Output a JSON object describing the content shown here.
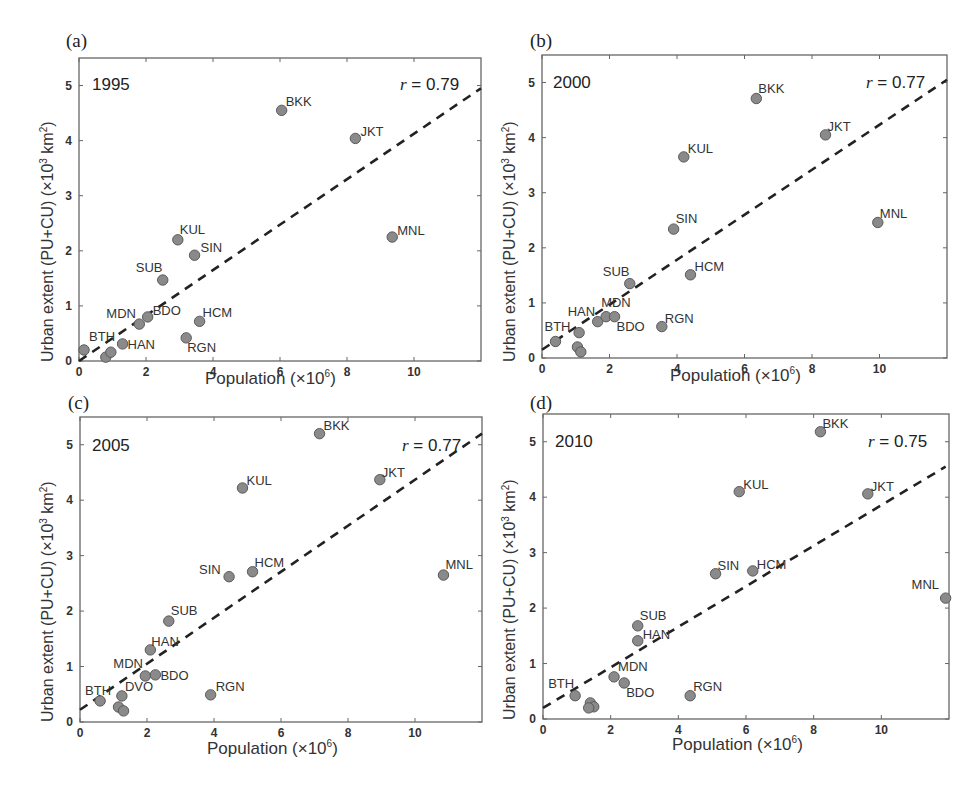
{
  "figure": {
    "xlabel_text": "Population (×10",
    "xlabel_exp": "6",
    "xlabel_close": ")",
    "ylabel_text": "Urban extent (PU+CU) (×10",
    "ylabel_exp": "3",
    "ylabel_unit": " km",
    "ylabel_unit_exp": "2",
    "ylabel_close": ")",
    "r_prefix": "r",
    "colors": {
      "marker_fill": "#8a8a8a",
      "marker_stroke": "#5a5a5a",
      "axis": "#666666",
      "fit_line": "#222222"
    }
  },
  "chart_data": [
    {
      "type": "scatter",
      "panel": "(a)",
      "title": "1995",
      "annotation": "= 0.79",
      "r": 0.79,
      "xlabel": "Population (×10^6)",
      "ylabel": "Urban extent (PU+CU) (×10^3 km^2)",
      "xlim": [
        0,
        12
      ],
      "ylim": [
        0,
        5.5
      ],
      "xticks": [
        0,
        2,
        4,
        6,
        8,
        10
      ],
      "yticks": [
        0,
        1,
        2,
        3,
        4,
        5
      ],
      "grid": false,
      "fit_line": [
        [
          0,
          0.0
        ],
        [
          12,
          4.95
        ]
      ],
      "points": [
        {
          "label": "BTH",
          "x": 0.15,
          "y": 0.2,
          "lx": 5,
          "ly": -9
        },
        {
          "label": "",
          "x": 0.8,
          "y": 0.07
        },
        {
          "label": "",
          "x": 0.95,
          "y": 0.16
        },
        {
          "label": "HAN",
          "x": 1.3,
          "y": 0.31,
          "lx": 5,
          "ly": 5
        },
        {
          "label": "MDN",
          "x": 1.8,
          "y": 0.67,
          "lx": -33,
          "ly": -6
        },
        {
          "label": "BDO",
          "x": 2.05,
          "y": 0.8,
          "lx": 5,
          "ly": -2
        },
        {
          "label": "SUB",
          "x": 2.5,
          "y": 1.47,
          "lx": -27,
          "ly": -8
        },
        {
          "label": "KUL",
          "x": 2.95,
          "y": 2.2,
          "lx": 2,
          "ly": -6
        },
        {
          "label": "SIN",
          "x": 3.45,
          "y": 1.92,
          "lx": 6,
          "ly": -3
        },
        {
          "label": "RGN",
          "x": 3.2,
          "y": 0.42,
          "lx": 1,
          "ly": 14
        },
        {
          "label": "HCM",
          "x": 3.6,
          "y": 0.72,
          "lx": 3,
          "ly": -4
        },
        {
          "label": "BKK",
          "x": 6.05,
          "y": 4.55,
          "lx": 4,
          "ly": -4
        },
        {
          "label": "JKT",
          "x": 8.25,
          "y": 4.04,
          "lx": 5,
          "ly": -2
        },
        {
          "label": "MNL",
          "x": 9.35,
          "y": 2.25,
          "lx": 5,
          "ly": -2
        }
      ]
    },
    {
      "type": "scatter",
      "panel": "(b)",
      "title": "2000",
      "annotation": "= 0.77",
      "r": 0.77,
      "xlabel": "Population (×10^6)",
      "ylabel": "Urban extent (PU+CU) (×10^3 km^2)",
      "xlim": [
        0,
        12
      ],
      "ylim": [
        0,
        5.5
      ],
      "xticks": [
        0,
        2,
        4,
        6,
        8,
        10
      ],
      "yticks": [
        0,
        1,
        2,
        3,
        4,
        5
      ],
      "grid": false,
      "fit_line": [
        [
          0,
          0.15
        ],
        [
          12,
          5.05
        ]
      ],
      "points": [
        {
          "label": "BTH",
          "x": 0.4,
          "y": 0.3,
          "lx": -11,
          "ly": -10
        },
        {
          "label": "",
          "x": 1.1,
          "y": 0.46
        },
        {
          "label": "",
          "x": 1.05,
          "y": 0.2
        },
        {
          "label": "",
          "x": 1.15,
          "y": 0.11
        },
        {
          "label": "HAN",
          "x": 1.65,
          "y": 0.66,
          "lx": -30,
          "ly": -6
        },
        {
          "label": "MDN",
          "x": 1.9,
          "y": 0.75,
          "lx": -5,
          "ly": -10
        },
        {
          "label": "BDO",
          "x": 2.15,
          "y": 0.75,
          "lx": 2,
          "ly": 14
        },
        {
          "label": "SUB",
          "x": 2.6,
          "y": 1.35,
          "lx": -27,
          "ly": -8
        },
        {
          "label": "RGN",
          "x": 3.55,
          "y": 0.57,
          "lx": 3,
          "ly": -4
        },
        {
          "label": "SIN",
          "x": 3.9,
          "y": 2.34,
          "lx": 2,
          "ly": -6
        },
        {
          "label": "HCM",
          "x": 4.4,
          "y": 1.51,
          "lx": 4,
          "ly": -4
        },
        {
          "label": "KUL",
          "x": 4.2,
          "y": 3.65,
          "lx": 4,
          "ly": -4
        },
        {
          "label": "BKK",
          "x": 6.35,
          "y": 4.71,
          "lx": 2,
          "ly": -6
        },
        {
          "label": "JKT",
          "x": 8.4,
          "y": 4.05,
          "lx": 2,
          "ly": -4
        },
        {
          "label": "MNL",
          "x": 9.95,
          "y": 2.46,
          "lx": 2,
          "ly": -4
        }
      ]
    },
    {
      "type": "scatter",
      "panel": "(c)",
      "title": "2005",
      "annotation": "= 0.77",
      "r": 0.77,
      "xlabel": "Population (×10^6)",
      "ylabel": "Urban extent (PU+CU) (×10^3 km^2)",
      "xlim": [
        0,
        12
      ],
      "ylim": [
        0,
        5.5
      ],
      "xticks": [
        0,
        2,
        4,
        6,
        8,
        10
      ],
      "yticks": [
        0,
        1,
        2,
        3,
        4,
        5
      ],
      "grid": false,
      "fit_line": [
        [
          0,
          0.22
        ],
        [
          12,
          5.2
        ]
      ],
      "points": [
        {
          "label": "BTH",
          "x": 0.6,
          "y": 0.38,
          "lx": -15,
          "ly": -6
        },
        {
          "label": "DVO",
          "x": 1.25,
          "y": 0.47,
          "lx": 3,
          "ly": -5
        },
        {
          "label": "",
          "x": 1.15,
          "y": 0.27
        },
        {
          "label": "",
          "x": 1.3,
          "y": 0.2
        },
        {
          "label": "MDN",
          "x": 1.95,
          "y": 0.83,
          "lx": -32,
          "ly": -8
        },
        {
          "label": "BDO",
          "x": 2.25,
          "y": 0.85,
          "lx": 5,
          "ly": 5
        },
        {
          "label": "HAN",
          "x": 2.1,
          "y": 1.3,
          "lx": 1,
          "ly": -4
        },
        {
          "label": "SUB",
          "x": 2.65,
          "y": 1.82,
          "lx": 2,
          "ly": -6
        },
        {
          "label": "RGN",
          "x": 3.9,
          "y": 0.49,
          "lx": 5,
          "ly": -4
        },
        {
          "label": "SIN",
          "x": 4.45,
          "y": 2.62,
          "lx": -30,
          "ly": -3
        },
        {
          "label": "HCM",
          "x": 5.15,
          "y": 2.71,
          "lx": 2,
          "ly": -5
        },
        {
          "label": "KUL",
          "x": 4.85,
          "y": 4.22,
          "lx": 4,
          "ly": -3
        },
        {
          "label": "BKK",
          "x": 7.15,
          "y": 5.2,
          "lx": 4,
          "ly": -4
        },
        {
          "label": "JKT",
          "x": 8.95,
          "y": 4.37,
          "lx": 2,
          "ly": -3
        },
        {
          "label": "MNL",
          "x": 10.85,
          "y": 2.65,
          "lx": 2,
          "ly": -6
        }
      ]
    },
    {
      "type": "scatter",
      "panel": "(d)",
      "title": "2010",
      "annotation": "= 0.75",
      "r": 0.75,
      "xlabel": "Population (×10^6)",
      "ylabel": "Urban extent (PU+CU) (×10^3 km^2)",
      "xlim": [
        0,
        12
      ],
      "ylim": [
        0,
        5.5
      ],
      "xticks": [
        0,
        2,
        4,
        6,
        8,
        10
      ],
      "yticks": [
        0,
        1,
        2,
        3,
        4,
        5
      ],
      "grid": false,
      "fit_line": [
        [
          0,
          0.2
        ],
        [
          11.9,
          4.55
        ]
      ],
      "points": [
        {
          "label": "BTH",
          "x": 0.95,
          "y": 0.42,
          "lx": -27,
          "ly": -8
        },
        {
          "label": "",
          "x": 1.4,
          "y": 0.29
        },
        {
          "label": "",
          "x": 1.5,
          "y": 0.22
        },
        {
          "label": "",
          "x": 1.35,
          "y": 0.2
        },
        {
          "label": "MDN",
          "x": 2.1,
          "y": 0.76,
          "lx": 0,
          "ly": -6
        },
        {
          "label": "BDO",
          "x": 2.4,
          "y": 0.65,
          "lx": 2,
          "ly": 14
        },
        {
          "label": "SUB",
          "x": 2.8,
          "y": 1.68,
          "lx": 2,
          "ly": -6
        },
        {
          "label": "HAN",
          "x": 2.8,
          "y": 1.41,
          "lx": 5,
          "ly": -2
        },
        {
          "label": "RGN",
          "x": 4.35,
          "y": 0.42,
          "lx": 3,
          "ly": -5
        },
        {
          "label": "SIN",
          "x": 5.1,
          "y": 2.62,
          "lx": 2,
          "ly": -4
        },
        {
          "label": "HCM",
          "x": 6.2,
          "y": 2.67,
          "lx": 4,
          "ly": -2
        },
        {
          "label": "KUL",
          "x": 5.8,
          "y": 4.1,
          "lx": 4,
          "ly": -3
        },
        {
          "label": "BKK",
          "x": 8.2,
          "y": 5.18,
          "lx": 2,
          "ly": -4
        },
        {
          "label": "JKT",
          "x": 9.6,
          "y": 4.06,
          "lx": 3,
          "ly": -3
        },
        {
          "label": "MNL",
          "x": 11.9,
          "y": 2.18,
          "lx": -34,
          "ly": -9
        }
      ]
    }
  ],
  "layout": [
    {
      "left": 79,
      "top": 58,
      "right": 481,
      "bottom": 361
    },
    {
      "left": 542,
      "top": 55,
      "right": 947,
      "bottom": 358
    },
    {
      "left": 80,
      "top": 417,
      "right": 482,
      "bottom": 722
    },
    {
      "left": 543,
      "top": 414,
      "right": 949,
      "bottom": 719
    }
  ]
}
